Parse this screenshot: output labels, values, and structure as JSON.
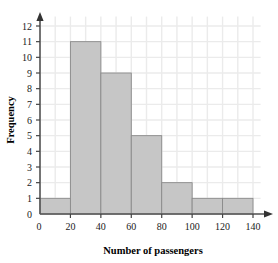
{
  "chart_data": {
    "type": "bar",
    "title": "",
    "subtitle": "",
    "xlabel": "Number of passengers",
    "ylabel": "Frequency",
    "xlim": [
      0,
      145
    ],
    "ylim": [
      0,
      12.6
    ],
    "grid": true,
    "legend": false,
    "legend_position": "none",
    "x_tick_labels": [
      "0",
      "20",
      "40",
      "60",
      "80",
      "100",
      "120",
      "140"
    ],
    "x_tick_values": [
      0,
      20,
      40,
      60,
      80,
      100,
      120,
      140
    ],
    "y_tick_labels": [
      "0",
      "1",
      "2",
      "3",
      "4",
      "5",
      "6",
      "7",
      "8",
      "9",
      "10",
      "11",
      "12"
    ],
    "y_tick_values": [
      0,
      1,
      2,
      3,
      4,
      5,
      6,
      7,
      8,
      9,
      10,
      11,
      12
    ],
    "x_minor_gridline_step": 10,
    "y_minor_gridline_step": 1,
    "bar_fill_color": "#c6c6c6",
    "bar_edge_color": "#8a8a8a",
    "gridline_color": "#ebebeb",
    "axis_color": "#555555",
    "bins": [
      {
        "label": "0-20",
        "start": 0,
        "end": 20,
        "frequency": 1
      },
      {
        "label": "20-40",
        "start": 20,
        "end": 40,
        "frequency": 11
      },
      {
        "label": "40-60",
        "start": 40,
        "end": 60,
        "frequency": 9
      },
      {
        "label": "60-80",
        "start": 60,
        "end": 80,
        "frequency": 5
      },
      {
        "label": "80-100",
        "start": 80,
        "end": 100,
        "frequency": 2
      },
      {
        "label": "100-120",
        "start": 100,
        "end": 120,
        "frequency": 1
      },
      {
        "label": "120-140",
        "start": 120,
        "end": 140,
        "frequency": 1
      }
    ],
    "categories": [
      "0-20",
      "20-40",
      "40-60",
      "60-80",
      "80-100",
      "100-120",
      "120-140"
    ],
    "values": [
      1,
      11,
      9,
      5,
      2,
      1,
      1
    ]
  },
  "axes": {
    "x_title": "Number of passengers",
    "y_title": "Frequency"
  }
}
